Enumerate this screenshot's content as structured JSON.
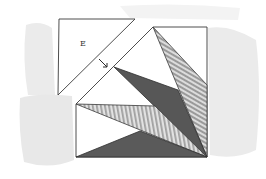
{
  "diagram": {
    "type": "quilt-block-piecing",
    "pieces": [
      {
        "id": "E",
        "label": "E",
        "shape": "triangle",
        "fill": "white"
      },
      {
        "id": "block-main",
        "shape": "pentagon",
        "fill": "white"
      },
      {
        "id": "dark-center",
        "shape": "triangle",
        "fill": "dark-gray"
      },
      {
        "id": "striped-top-right",
        "shape": "triangle",
        "fill": "striped"
      },
      {
        "id": "striped-middle",
        "shape": "triangle",
        "fill": "striped"
      },
      {
        "id": "dark-bottom",
        "shape": "triangle",
        "fill": "dark-gray"
      }
    ],
    "annotation": {
      "type": "arrow",
      "direction": "down-right",
      "meaning": "join piece E to block"
    }
  },
  "labels": {
    "piece_e": "E"
  },
  "colors": {
    "background": "#ffffff",
    "shadow": "#e6e6e6",
    "outline": "#3a3a3a",
    "dark_fill": "#555555",
    "stripe_light": "#dcdcdc",
    "stripe_dark": "#9a9a9a"
  }
}
